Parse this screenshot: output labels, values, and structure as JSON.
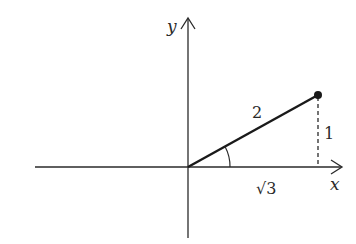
{
  "diagram": {
    "type": "right-triangle-in-coordinate-plane",
    "axes": {
      "x_label": "x",
      "y_label": "y"
    },
    "labels": {
      "hypotenuse": "2",
      "opposite": "1",
      "adjacent": "√3"
    },
    "point": {
      "x": "√3",
      "y": "1"
    },
    "colors": {
      "stroke": "#2a2a2a",
      "background": "#ffffff"
    }
  }
}
